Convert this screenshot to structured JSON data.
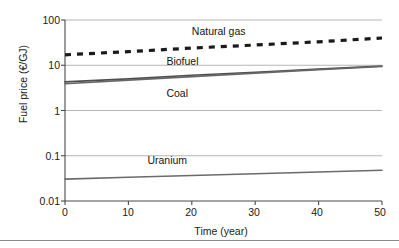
{
  "chart_data": {
    "type": "line",
    "title": "",
    "xlabel": "Time (year)",
    "ylabel": "Fuel price (€/GJ)",
    "xlim": [
      0,
      50
    ],
    "ylim": [
      0.01,
      100
    ],
    "yscale": "log",
    "grid": "horizontal",
    "legend_position": "inline-annotations",
    "xticks": [
      "0",
      "10",
      "20",
      "30",
      "40",
      "50"
    ],
    "xtick_values": [
      0,
      10,
      20,
      30,
      40,
      50
    ],
    "yticks": [
      "0.01",
      "0.1",
      "1",
      "10",
      "100"
    ],
    "ytick_values": [
      0.01,
      0.1,
      1,
      10,
      100
    ],
    "series": [
      {
        "name": "Natural gas",
        "style": "dashed",
        "color": "#1a1a1a",
        "x": [
          0,
          10,
          20,
          30,
          40,
          50
        ],
        "values": [
          17,
          20,
          24,
          28,
          33,
          40
        ],
        "label_x": 20,
        "label_y": 55
      },
      {
        "name": "Biofuel",
        "style": "solid",
        "color": "#4d4d4d",
        "x": [
          0,
          10,
          20,
          30,
          40,
          50
        ],
        "values": [
          4.3,
          5.0,
          6.0,
          7.0,
          8.2,
          9.6
        ],
        "label_x": 16,
        "label_y": 12
      },
      {
        "name": "Coal",
        "style": "solid",
        "color": "#666666",
        "x": [
          0,
          10,
          20,
          30,
          40,
          50
        ],
        "values": [
          3.9,
          4.7,
          5.6,
          6.7,
          8.0,
          9.4
        ],
        "label_x": 16,
        "label_y": 2.3
      },
      {
        "name": "Uranium",
        "style": "solid",
        "color": "#6b6b6b",
        "x": [
          0,
          10,
          20,
          30,
          40,
          50
        ],
        "values": [
          0.0305,
          0.0335,
          0.0366,
          0.04,
          0.0437,
          0.0478
        ],
        "label_x": 13,
        "label_y": 0.075
      }
    ]
  },
  "colors": {
    "axis": "#4a4a4a",
    "grid": "#b5b5b5",
    "text": "#1a1a1a",
    "figure_rule": "#8a8a8a"
  }
}
